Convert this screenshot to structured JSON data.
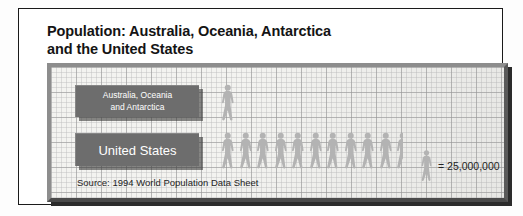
{
  "title": {
    "line1": "Population: Australia, Oceania, Antarctica",
    "line2": "and the United States"
  },
  "labels": {
    "series1_line1": "Australia, Oceania",
    "series1_line2": "and Antarctica",
    "series2": "United States"
  },
  "legend": {
    "equals_text": "= 25,000,000",
    "icon": "person-icon"
  },
  "source": "Source: 1994 World Population Data Sheet",
  "colors": {
    "plaque": "#6d6d6d",
    "figure": "#b3b3b3",
    "grid_paper": "#f3f3f0",
    "frame": "#6e6e6e",
    "text_dark": "#141414"
  },
  "chart_data": {
    "type": "pictogram",
    "title": "Population: Australia, Oceania, Antarctica and the United States",
    "xlabel": "",
    "ylabel": "",
    "unit_value": 25000000,
    "unit_label": "= 25,000,000",
    "icon": "walking-person",
    "categories": [
      "Australia, Oceania and Antarctica",
      "United States"
    ],
    "values": [
      25000000,
      262500000
    ],
    "icon_counts": [
      1,
      10.5
    ],
    "source": "Source: 1994 World Population Data Sheet",
    "grid": true,
    "legend_position": "bottom-right"
  }
}
